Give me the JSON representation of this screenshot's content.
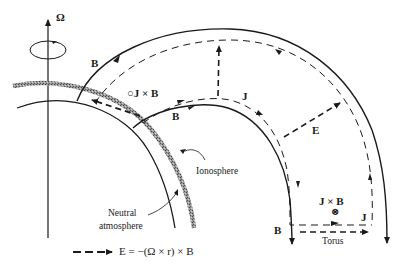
{
  "diagram": {
    "labels": {
      "omega": "Ω",
      "b_outer": "B",
      "jxb_circle": "○J × B",
      "b_inner": "B",
      "j_upper": "J",
      "e_field": "E",
      "ionosphere": "Ionosphere",
      "neutral_line1": "Neutral",
      "neutral_line2": "atmosphere",
      "jxb_torus": "J × B",
      "otimes": "⊗",
      "j_torus": "J",
      "b_bottom": "B",
      "torus": "Torus"
    },
    "legend": {
      "equation": "E = −(Ω × r) × B"
    },
    "colors": {
      "ink": "#1a1a1a",
      "ionosphere": "#8a8a8a"
    }
  }
}
